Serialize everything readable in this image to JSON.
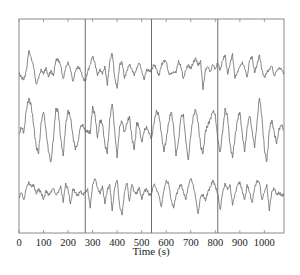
{
  "chart_data": {
    "type": "line",
    "title": "",
    "xlabel": "Time (s)",
    "ylabel": "",
    "xlim": [
      0,
      1080
    ],
    "xticks": [
      0,
      100,
      200,
      300,
      400,
      500,
      600,
      700,
      800,
      900,
      1000
    ],
    "xtick_labels": [
      "0",
      "100",
      "200",
      "300",
      "400",
      "500",
      "600",
      "700",
      "800",
      "900",
      "1000"
    ],
    "yticks": [],
    "grid": false,
    "legend": "none",
    "segment_dividers_s": [
      270,
      540,
      810
    ],
    "line_color": "#6a6a6a",
    "x_sample_step_s": 10,
    "series": [
      {
        "name": "trace-1",
        "values": [
          0.0,
          -0.3,
          -0.5,
          0.2,
          1.6,
          1.1,
          0.4,
          -0.8,
          -0.4,
          0.3,
          -0.1,
          0.4,
          -0.3,
          0.2,
          -0.2,
          0.9,
          1.0,
          0.5,
          -0.4,
          0.3,
          0.8,
          0.2,
          -0.6,
          0.1,
          0.5,
          0.2,
          -0.3,
          -0.6,
          0.1,
          0.6,
          1.2,
          0.7,
          -0.2,
          0.3,
          -0.1,
          0.5,
          -0.9,
          0.9,
          1.4,
          -0.3,
          -1.1,
          0.6,
          0.8,
          -0.4,
          0.2,
          0.6,
          0.3,
          -0.2,
          0.4,
          0.7,
          0.2,
          -0.5,
          0.3,
          0.1,
          0.2,
          0.6,
          0.3,
          -0.2,
          0.5,
          0.9,
          0.8,
          0.0,
          -0.1,
          0.1,
          0.0,
          0.9,
          0.4,
          -0.4,
          0.2,
          0.6,
          0.3,
          0.7,
          1.1,
          0.5,
          0.9,
          -1.2,
          0.3,
          0.4,
          0.1,
          0.6,
          0.3,
          0.7,
          0.2,
          0.9,
          1.3,
          -0.1,
          0.6,
          1.4,
          -0.4,
          0.1,
          0.4,
          0.8,
          0.3,
          -0.3,
          0.9,
          1.2,
          0.0,
          0.6,
          1.3,
          0.2,
          -0.3,
          0.0,
          0.3,
          0.5,
          -0.2,
          0.1,
          0.4,
          0.2,
          0.0
        ]
      },
      {
        "name": "trace-2",
        "values": [
          0.0,
          0.3,
          0.1,
          1.2,
          1.8,
          1.4,
          0.4,
          -0.6,
          -1.0,
          0.6,
          1.1,
          0.2,
          -0.9,
          -1.4,
          -0.3,
          1.3,
          1.1,
          -0.2,
          -1.1,
          0.4,
          1.2,
          0.8,
          -0.1,
          -0.8,
          -0.4,
          0.3,
          0.5,
          0.1,
          0.2,
          0.0,
          1.4,
          0.9,
          -0.2,
          0.7,
          0.5,
          -0.5,
          -1.0,
          0.8,
          1.5,
          0.2,
          -1.2,
          0.4,
          0.6,
          0.1,
          0.5,
          0.9,
          -0.2,
          -0.8,
          0.6,
          0.3,
          -0.4,
          0.1,
          0.4,
          0.0,
          -0.2,
          0.5,
          1.2,
          0.9,
          0.1,
          -0.9,
          -0.3,
          0.6,
          1.1,
          0.4,
          -1.1,
          -0.3,
          0.8,
          1.0,
          -0.4,
          -1.3,
          -0.1,
          0.9,
          1.2,
          0.6,
          -0.6,
          -1.0,
          0.2,
          0.4,
          0.8,
          1.1,
          1.0,
          -0.3,
          -0.9,
          0.1,
          1.3,
          0.8,
          -0.5,
          -1.2,
          -0.2,
          0.7,
          1.1,
          0.0,
          -0.9,
          0.4,
          0.9,
          0.2,
          -0.7,
          0.6,
          1.8,
          0.9,
          -0.8,
          -1.4,
          0.2,
          0.7,
          0.1,
          -0.5,
          0.3,
          0.4,
          0.2
        ]
      },
      {
        "name": "trace-3",
        "values": [
          0.0,
          0.3,
          -0.2,
          0.6,
          1.1,
          0.7,
          0.9,
          0.2,
          0.6,
          0.3,
          -0.2,
          0.5,
          0.1,
          0.4,
          0.6,
          0.2,
          0.3,
          0.8,
          -0.4,
          1.0,
          0.5,
          -0.5,
          0.6,
          0.3,
          0.1,
          0.4,
          0.2,
          0.3,
          0.6,
          -0.8,
          0.9,
          1.3,
          0.7,
          0.2,
          0.8,
          -0.5,
          0.5,
          0.9,
          -1.0,
          0.7,
          1.2,
          -0.6,
          -1.3,
          0.4,
          1.0,
          -0.3,
          0.9,
          0.4,
          0.2,
          0.7,
          -0.2,
          0.4,
          0.6,
          0.1,
          0.3,
          0.9,
          0.6,
          0.1,
          -0.7,
          0.4,
          1.2,
          0.9,
          -0.2,
          -0.8,
          0.1,
          0.6,
          0.9,
          0.4,
          -0.2,
          0.8,
          1.3,
          0.9,
          -0.1,
          -1.2,
          0.0,
          0.2,
          -0.3,
          0.4,
          0.7,
          1.2,
          0.8,
          0.2,
          -0.9,
          0.3,
          1.0,
          0.5,
          0.9,
          -0.6,
          0.2,
          0.8,
          1.1,
          0.4,
          -0.2,
          0.9,
          0.3,
          -0.4,
          0.6,
          1.2,
          1.0,
          -0.2,
          0.3,
          0.9,
          -1.0,
          0.4,
          0.6,
          0.2,
          0.3,
          0.1,
          0.2
        ]
      }
    ]
  }
}
